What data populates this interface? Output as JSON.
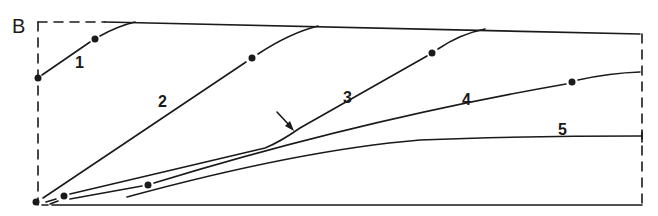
{
  "panel_label": "B",
  "curves": [
    {
      "id": "1",
      "label": "1"
    },
    {
      "id": "2",
      "label": "2"
    },
    {
      "id": "3",
      "label": "3"
    },
    {
      "id": "4",
      "label": "4"
    },
    {
      "id": "5",
      "label": "5"
    }
  ],
  "annotations": {
    "arrow": "arrow pointing to inflection of curve 3"
  },
  "colors": {
    "line": "#1a1a1a",
    "background": "#ffffff"
  }
}
